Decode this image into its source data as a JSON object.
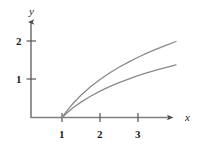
{
  "figure": {
    "background_color": "#ffffff",
    "axis_color": "#4a4a4a",
    "curve_color": "#8a8a8a",
    "text_color": "#1a1a1a"
  },
  "chart_data": {
    "type": "line",
    "title": "",
    "xlabel": "x",
    "ylabel": "y",
    "grid": false,
    "legend": "none",
    "xlim": [
      0,
      4.4
    ],
    "ylim": [
      0,
      2.4
    ],
    "xticks": [
      1,
      2,
      3
    ],
    "xtick_labels": [
      "1",
      "2",
      "3"
    ],
    "yticks": [
      1,
      2
    ],
    "ytick_labels": [
      "1",
      "2"
    ],
    "series": [
      {
        "name": "upper-curve",
        "x": [
          1.0,
          1.15,
          1.3,
          1.5,
          1.75,
          2.0,
          2.25,
          2.5,
          2.75,
          3.0,
          3.25,
          3.5,
          3.75,
          4.0
        ],
        "values": [
          0.0,
          0.2,
          0.38,
          0.585,
          0.807,
          1.0,
          1.17,
          1.322,
          1.459,
          1.585,
          1.7,
          1.807,
          1.907,
          2.0
        ]
      },
      {
        "name": "lower-curve",
        "x": [
          1.0,
          1.15,
          1.3,
          1.5,
          1.75,
          2.0,
          2.25,
          2.5,
          2.75,
          3.0,
          3.25,
          3.5,
          3.75,
          4.0
        ],
        "values": [
          0.0,
          0.14,
          0.262,
          0.405,
          0.56,
          0.693,
          0.811,
          0.916,
          1.012,
          1.099,
          1.179,
          1.253,
          1.322,
          1.386
        ]
      }
    ],
    "annotations": []
  },
  "labels": {
    "y_axis": "y",
    "x_axis": "x",
    "y_tick_2": "2",
    "y_tick_1": "1",
    "x_tick_1": "1",
    "x_tick_2": "2",
    "x_tick_3": "3"
  }
}
